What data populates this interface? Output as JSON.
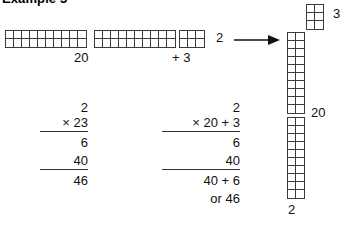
{
  "title": "Example 3",
  "top_row": {
    "blocks": [
      {
        "name": "tens-block-1",
        "cols": 10,
        "rows": 2,
        "cell": 8
      },
      {
        "name": "tens-block-2",
        "cols": 10,
        "rows": 2,
        "cell": 8
      },
      {
        "name": "ones-block",
        "cols": 3,
        "rows": 2,
        "cell": 8
      }
    ],
    "label_tens": "20",
    "label_ones": "+ 3",
    "label_rows": "2",
    "arrow_icon": "right-arrow-icon"
  },
  "right_diagram": {
    "ones_block": {
      "name": "ones-block-vertical",
      "cols": 2,
      "rows": 3,
      "cell": 8
    },
    "ones_label": "3",
    "tens_block_top": {
      "name": "tens-block-vertical-1",
      "cols": 2,
      "rows": 10,
      "cell": 8
    },
    "tens_block_bottom": {
      "name": "tens-block-vertical-2",
      "cols": 2,
      "rows": 10,
      "cell": 8
    },
    "tens_label": "20",
    "width_label": "2"
  },
  "calc_left": {
    "multiplicand": "2",
    "multiplier": "× 23",
    "partial_1": "6",
    "partial_2": "40",
    "total": "46"
  },
  "calc_right": {
    "multiplicand": "2",
    "multiplier": "× 20 + 3",
    "partial_1": "6",
    "partial_2": "40",
    "sum_expression": "40 + 6",
    "or_result": "or 46"
  },
  "colors": {
    "ink": "#111111",
    "grid_outer": "#3b3b3b",
    "grid_inner": "#3b3b3b",
    "background": "#ffffff"
  }
}
